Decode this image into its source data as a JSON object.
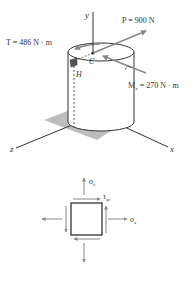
{
  "figure": {
    "axes": {
      "x_label": "x",
      "y_label": "y",
      "z_label": "z"
    },
    "loads": {
      "P_label": "P = 900 N",
      "T_label": "T = 486 N · m",
      "M_label_main": "M",
      "M_label_sub": "x",
      "M_label_rest": " = 270 N · m"
    },
    "points": {
      "C_label": "C",
      "H_label": "H"
    },
    "stress_element": {
      "sigma_y_main": "σ",
      "sigma_y_sub": "y",
      "sigma_x_main": "σ",
      "sigma_x_sub": "x",
      "tau_main": "τ",
      "tau_sub": "xy"
    },
    "colors": {
      "line": "#333333",
      "arrow": "#808080",
      "shadow": "#b8b8b8",
      "cylinder_fill": "#ffffff"
    }
  }
}
